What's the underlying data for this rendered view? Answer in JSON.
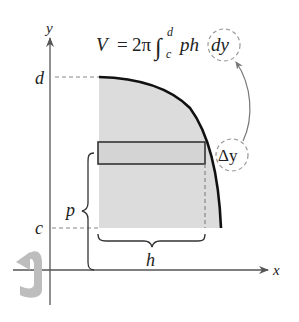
{
  "figure": {
    "formula": {
      "lhs": "V",
      "equals": "=",
      "coef": "2π",
      "integral": "∫",
      "upper": "d",
      "lower": "c",
      "integrand": "ph",
      "differential": "dy"
    },
    "axes": {
      "x_label": "x",
      "y_label": "y"
    },
    "labels": {
      "d": "d",
      "c": "c",
      "p": "p",
      "h": "h",
      "delta_y": "Δy"
    },
    "colors": {
      "shade": "#dcdcdc",
      "axis": "#555555",
      "curve": "#111111",
      "dashed": "#888888",
      "rotation_arrow": "#bdbdbd"
    }
  }
}
